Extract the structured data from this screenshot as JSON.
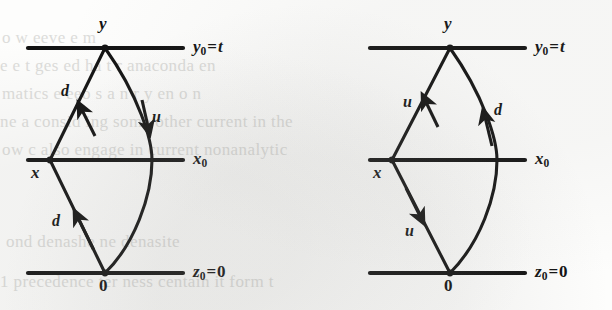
{
  "figure": {
    "caption": "",
    "background_color": "#fdfdfc",
    "ink_color": "#111111",
    "ghost_text_color": "#c9c9c6"
  },
  "axes": {
    "top": {
      "label_plain": "y0 = t",
      "var": "y",
      "sub": "0",
      "eq": "=",
      "rhs": "t",
      "rhs_italic": true
    },
    "middle": {
      "label_plain": "x0",
      "var": "x",
      "sub": "0",
      "eq": "",
      "rhs": "",
      "rhs_italic": false
    },
    "bottom": {
      "label_plain": "z0 = 0",
      "var": "z",
      "sub": "0",
      "eq": "=",
      "rhs": "0",
      "rhs_italic": false
    }
  },
  "diagrams": [
    {
      "id": "left-diagram",
      "name": "diagram-left",
      "vertices": [
        {
          "name": "vertex-y",
          "label": "y",
          "italic": true
        },
        {
          "name": "vertex-x",
          "label": "x",
          "italic": true
        },
        {
          "name": "vertex-0",
          "label": "0",
          "italic": false
        }
      ],
      "edges": [
        {
          "name": "edge-lower-left",
          "label": "d",
          "direction": "up"
        },
        {
          "name": "edge-upper-left",
          "label": "d",
          "direction": "up"
        },
        {
          "name": "edge-right-curve",
          "label": "u",
          "direction": "down"
        }
      ]
    },
    {
      "id": "right-diagram",
      "name": "diagram-right",
      "vertices": [
        {
          "name": "vertex-y",
          "label": "y",
          "italic": true
        },
        {
          "name": "vertex-x",
          "label": "x",
          "italic": true
        },
        {
          "name": "vertex-0",
          "label": "0",
          "italic": false
        }
      ],
      "edges": [
        {
          "name": "edge-upper-left",
          "label": "u",
          "direction": "down"
        },
        {
          "name": "edge-lower-left",
          "label": "u",
          "direction": "down"
        },
        {
          "name": "edge-right-curve",
          "label": "d",
          "direction": "up"
        }
      ]
    }
  ],
  "ghost_text": [
    "",
    "",
    "",
    ""
  ]
}
